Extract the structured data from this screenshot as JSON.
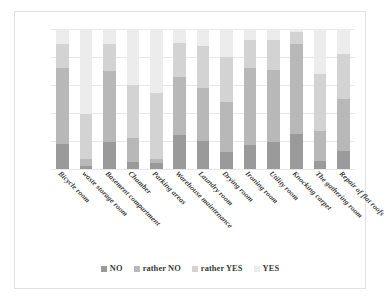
{
  "chart_data": {
    "type": "bar",
    "title": "",
    "subtitle": "",
    "xlabel": "",
    "ylabel": "",
    "stacked": true,
    "normalized": true,
    "ylim": [
      0,
      100
    ],
    "grid": true,
    "gridlines": [
      0,
      20,
      40,
      60,
      80,
      100
    ],
    "legend_position": "bottom",
    "categories": [
      "Bicycle room",
      "waste storage room",
      "Basement compartment",
      "Chamber",
      "Parking areas",
      "Warehouse maintenance",
      "Laundry room",
      "Drying room",
      "Ironing room",
      "Utility room",
      "Knocking carpet",
      "The gathering room",
      "Repair of flat roofs"
    ],
    "series": [
      {
        "name": "NO",
        "color": "#9a9a9a",
        "values": [
          18,
          2,
          19,
          5,
          4,
          24,
          20,
          12,
          17,
          19,
          25,
          6,
          13
        ]
      },
      {
        "name": "rather NO",
        "color": "#b8b8b8",
        "values": [
          54,
          5,
          51,
          17,
          3,
          42,
          38,
          36,
          55,
          52,
          64,
          21,
          37
        ]
      },
      {
        "name": "rather YES",
        "color": "#d3d3d3",
        "values": [
          17,
          32,
          19,
          38,
          47,
          24,
          30,
          32,
          20,
          21,
          9,
          41,
          32
        ]
      },
      {
        "name": "YES",
        "color": "#ececec",
        "values": [
          11,
          61,
          11,
          40,
          46,
          10,
          12,
          20,
          8,
          8,
          2,
          32,
          18
        ]
      }
    ]
  },
  "legend": {
    "items": [
      {
        "label": "NO",
        "color": "#9a9a9a"
      },
      {
        "label": "rather NO",
        "color": "#b8b8b8"
      },
      {
        "label": "rather YES",
        "color": "#d3d3d3"
      },
      {
        "label": "YES",
        "color": "#ececec"
      }
    ]
  },
  "colors": {
    "frame_border": "#e2e2e2",
    "gridline": "#e8e8e8",
    "label_text": "#3b3b3b",
    "background": "#ffffff"
  }
}
